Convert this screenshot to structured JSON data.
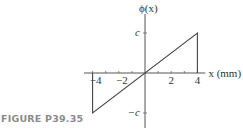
{
  "caption": "FIGURE P39.35",
  "chart_data": {
    "type": "line",
    "title": "",
    "xlabel": "x (mm)",
    "ylabel": "ϕ(x)",
    "xlim": [
      -4.5,
      4.5
    ],
    "ylim": [
      -1.2,
      1.3
    ],
    "x_ticks": [
      -4,
      -3,
      -2,
      -1,
      1,
      2,
      3,
      4
    ],
    "x_tick_labels": [
      {
        "value": -4,
        "label": "−4"
      },
      {
        "value": -2,
        "label": "−2"
      },
      {
        "value": 2,
        "label": "2"
      },
      {
        "value": 4,
        "label": "4"
      }
    ],
    "y_tick_labels": [
      {
        "value": 1,
        "label": "c"
      },
      {
        "value": -1,
        "label": "−c"
      }
    ],
    "series": [
      {
        "name": "ϕ(x)",
        "points": [
          {
            "x": -4,
            "y": 0
          },
          {
            "x": -4,
            "y": -1
          },
          {
            "x": 4,
            "y": 1
          },
          {
            "x": 4,
            "y": 0
          }
        ]
      }
    ],
    "grid": false,
    "legend": "none"
  }
}
